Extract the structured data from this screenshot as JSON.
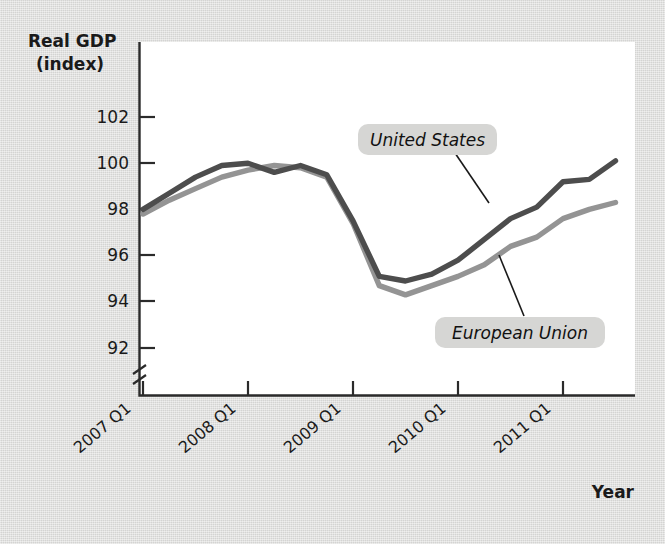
{
  "chart_data": {
    "type": "line",
    "title": "",
    "subtitle": "",
    "ylabel": "Real GDP",
    "ylabel_line2": "(index)",
    "xlabel": "Year",
    "ylim": [
      91.2,
      102.6
    ],
    "yticks": [
      92,
      94,
      96,
      98,
      100,
      102
    ],
    "ytick_labels": [
      "92",
      "94",
      "96",
      "98",
      "100",
      "102"
    ],
    "y_axis_break": true,
    "grid": false,
    "legend_position": "inline-callout",
    "xtick_labels": [
      "2007 Q1",
      "2008 Q1",
      "2009 Q1",
      "2010 Q1",
      "2011 Q1"
    ],
    "xticks": [
      0,
      4,
      8,
      12,
      16
    ],
    "x": [
      0,
      1,
      2,
      3,
      4,
      5,
      6,
      7,
      8,
      9,
      10,
      11,
      12,
      13,
      14,
      15,
      16,
      17,
      18
    ],
    "x_quarter_labels": [
      "2007 Q1",
      "2007 Q2",
      "2007 Q3",
      "2007 Q4",
      "2008 Q1",
      "2008 Q2",
      "2008 Q3",
      "2008 Q4",
      "2009 Q1",
      "2009 Q2",
      "2009 Q3",
      "2009 Q4",
      "2010 Q1",
      "2010 Q2",
      "2010 Q3",
      "2010 Q4",
      "2011 Q1",
      "2011 Q2",
      "2011 Q3"
    ],
    "series": [
      {
        "name": "United States",
        "color": "#4d4d4d",
        "values": [
          98.0,
          98.7,
          99.4,
          99.9,
          100.0,
          99.6,
          99.9,
          99.5,
          97.5,
          95.1,
          94.9,
          95.2,
          95.8,
          96.7,
          97.6,
          98.1,
          99.2,
          99.3,
          100.1
        ]
      },
      {
        "name": "European Union",
        "color": "#949494",
        "values": [
          97.8,
          98.4,
          98.9,
          99.4,
          99.7,
          99.9,
          99.8,
          99.4,
          97.4,
          94.7,
          94.3,
          94.7,
          95.1,
          95.6,
          96.4,
          96.8,
          97.6,
          98.0,
          98.3
        ]
      }
    ],
    "annotations": [
      {
        "label": "United States",
        "target_series": "United States"
      },
      {
        "label": "European Union",
        "target_series": "European Union"
      }
    ]
  },
  "figure": {
    "background_color": "#dcdcda",
    "plot_background_color": "#ffffff",
    "axis_color": "#2b2b2b",
    "callout_fill": "#d6d6d4"
  }
}
